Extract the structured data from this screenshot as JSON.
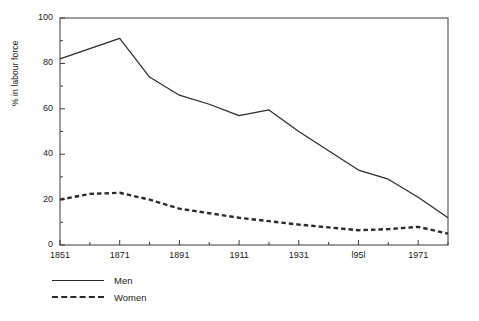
{
  "chart_data": {
    "type": "line",
    "title": "",
    "subtitle": "",
    "xlabel": "",
    "ylabel": "% in labour force",
    "xlim": [
      1851,
      1981
    ],
    "ylim": [
      0,
      100
    ],
    "grid": false,
    "legend_position": "below-left",
    "x_tick_labels": [
      "1851",
      "1871",
      "1891",
      "1911",
      "1931",
      "l95l",
      "1971"
    ],
    "x_tick_values": [
      1851,
      1871,
      1891,
      1911,
      1931,
      1951,
      1971
    ],
    "x_minor_tick_values": [
      1861,
      1881,
      1901,
      1921,
      1941,
      1961,
      1981
    ],
    "y_tick_labels": [
      "0",
      "20",
      "40",
      "60",
      "80",
      "100"
    ],
    "y_tick_values": [
      0,
      20,
      40,
      60,
      80,
      100
    ],
    "y_minor_tick_values": [
      10,
      30,
      50,
      70,
      90
    ],
    "x": [
      1851,
      1861,
      1871,
      1881,
      1891,
      1901,
      1911,
      1921,
      1931,
      1951,
      1961,
      1971,
      1981
    ],
    "series": [
      {
        "name": "Men",
        "style": "solid",
        "color": "#2a2a2a",
        "values": [
          82,
          86.5,
          91,
          74,
          66,
          62,
          57,
          59.5,
          50,
          33,
          29,
          21,
          12
        ]
      },
      {
        "name": "Women",
        "style": "dashed",
        "color": "#2a2a2a",
        "values": [
          20,
          22.5,
          23,
          20,
          16,
          14,
          12,
          10.5,
          9,
          6.5,
          7,
          8,
          5
        ]
      }
    ]
  },
  "legend": {
    "items": [
      {
        "label": "Men",
        "style": "solid"
      },
      {
        "label": "Women",
        "style": "dashed"
      }
    ]
  },
  "axes": {
    "y_title": "% in labour force"
  }
}
